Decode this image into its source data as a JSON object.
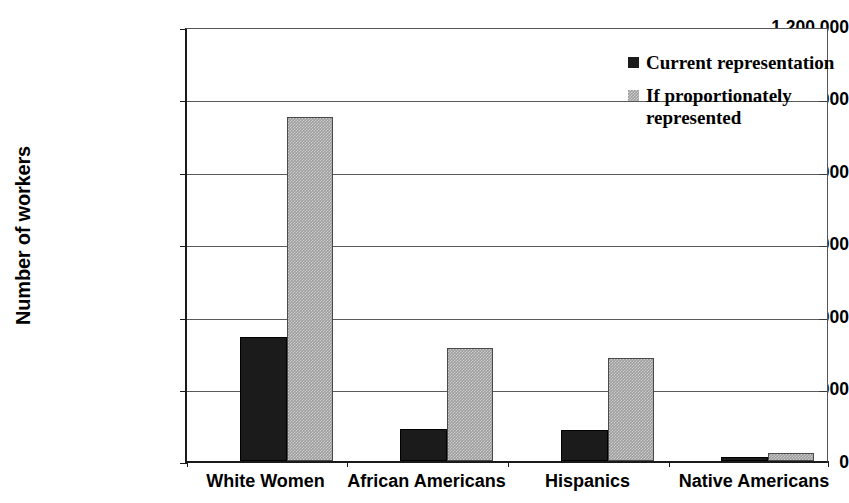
{
  "chart_data": {
    "type": "bar",
    "title": "",
    "subtitle": "",
    "xlabel": "",
    "ylabel": "Number of workers",
    "categories": [
      "White Women",
      "African Americans",
      "Hispanics",
      "Native Americans"
    ],
    "series": [
      {
        "name": "Current representation",
        "color": "#1b1b1b",
        "values": [
          345000,
          90000,
          85000,
          10000
        ]
      },
      {
        "name": "If proportionately represented",
        "color": "#9d9d9d",
        "values": [
          955000,
          313000,
          287000,
          22000
        ]
      }
    ],
    "ylim": [
      0,
      1200000
    ],
    "ytick_values": [
      0,
      200000,
      400000,
      600000,
      800000,
      1000000,
      1200000
    ],
    "ytick_labels": [
      "0",
      "200,000",
      "400,000",
      "600,000",
      "800,000",
      "1,000,000",
      "1,200,000"
    ],
    "grid": true,
    "grid_axis": "y",
    "legend_position": "top-right",
    "legend": [
      {
        "label": "Current representation",
        "swatch": "black-square-icon"
      },
      {
        "label": "If proportionately represented",
        "swatch": "gray-hatched-square-icon"
      }
    ]
  },
  "axes": {
    "y_title": "Number of workers",
    "y_ticks": [
      {
        "label": "1,200,000",
        "value": 1200000
      },
      {
        "label": "1,000,000",
        "value": 1000000
      },
      {
        "label": "800,000",
        "value": 800000
      },
      {
        "label": "600,000",
        "value": 600000
      },
      {
        "label": "400,000",
        "value": 400000
      },
      {
        "label": "200,000",
        "value": 200000
      },
      {
        "label": "0",
        "value": 0
      }
    ],
    "x_ticks": [
      {
        "label": "White Women"
      },
      {
        "label": "African Americans"
      },
      {
        "label": "Hispanics"
      },
      {
        "label": "Native Americans"
      }
    ]
  },
  "legend": {
    "entries": [
      {
        "label": "Current representation"
      },
      {
        "label": "If proportionately represented"
      }
    ]
  }
}
